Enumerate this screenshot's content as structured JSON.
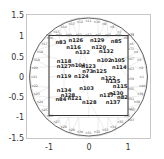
{
  "chart_data": {
    "type": "scatter",
    "title": "",
    "xlabel": "",
    "ylabel": "",
    "xlim": [
      -1.55,
      1.55
    ],
    "ylim": [
      -1.55,
      1.55
    ],
    "xticks": [
      "-1",
      "0",
      "1"
    ],
    "yticks": [
      "1.5",
      "1",
      "0.5",
      "0",
      "-0.5",
      "-1",
      "-1.5"
    ],
    "grid": false,
    "legend": null,
    "shapes": [
      {
        "kind": "circle",
        "center": [
          0,
          0
        ],
        "radius": 1.5,
        "color": "#555555"
      },
      {
        "kind": "square",
        "x": [
          -1,
          1
        ],
        "y": [
          -1,
          1
        ],
        "color": "#333333"
      }
    ],
    "interior_nodes": [
      {
        "label": "n83",
        "x": -0.7,
        "y": 0.86
      },
      {
        "label": "n126",
        "x": -0.32,
        "y": 0.92
      },
      {
        "label": "n129",
        "x": 0.22,
        "y": 0.92
      },
      {
        "label": "n85",
        "x": 0.7,
        "y": 0.88
      },
      {
        "label": "n116",
        "x": -0.38,
        "y": 0.73
      },
      {
        "label": "n120",
        "x": 0.26,
        "y": 0.75
      },
      {
        "label": "n132",
        "x": -0.15,
        "y": 0.62
      },
      {
        "label": "n132",
        "x": 0.45,
        "y": 0.63
      },
      {
        "label": "n118",
        "x": -0.62,
        "y": 0.4
      },
      {
        "label": "n127",
        "x": -0.62,
        "y": 0.27
      },
      {
        "label": "n104",
        "x": -0.26,
        "y": 0.3
      },
      {
        "label": "n102",
        "x": 0.4,
        "y": 0.43
      },
      {
        "label": "n105",
        "x": 0.74,
        "y": 0.43
      },
      {
        "label": "n123",
        "x": 0.0,
        "y": 0.27
      },
      {
        "label": "n73",
        "x": -0.02,
        "y": 0.15
      },
      {
        "label": "n125",
        "x": 0.28,
        "y": 0.15
      },
      {
        "label": "n114",
        "x": 0.78,
        "y": 0.25
      },
      {
        "label": "n119",
        "x": -0.62,
        "y": 0.03
      },
      {
        "label": "n124",
        "x": -0.18,
        "y": 0.03
      },
      {
        "label": "n122",
        "x": 0.5,
        "y": -0.02
      },
      {
        "label": "n135",
        "x": 0.62,
        "y": -0.1
      },
      {
        "label": "n134",
        "x": -0.62,
        "y": -0.32
      },
      {
        "label": "n103",
        "x": -0.05,
        "y": -0.28
      },
      {
        "label": "n115",
        "x": 0.8,
        "y": -0.22
      },
      {
        "label": "n128",
        "x": -0.52,
        "y": -0.45
      },
      {
        "label": "n117",
        "x": 0.46,
        "y": -0.45
      },
      {
        "label": "n130",
        "x": 0.7,
        "y": -0.4
      },
      {
        "label": "n82",
        "x": 0.86,
        "y": -0.5
      },
      {
        "label": "n84",
        "x": -0.7,
        "y": -0.55
      },
      {
        "label": "n121",
        "x": -0.35,
        "y": -0.52
      },
      {
        "label": "n128",
        "x": 0.02,
        "y": -0.62
      },
      {
        "label": "n137",
        "x": 0.62,
        "y": -0.62
      }
    ]
  },
  "axes": {
    "x_ticks": [
      {
        "label": "-1",
        "px": 49
      },
      {
        "label": "0",
        "px": 89
      },
      {
        "label": "1",
        "px": 128
      }
    ],
    "y_ticks": [
      {
        "label": "1.5",
        "py": 15
      },
      {
        "label": "1",
        "py": 36
      },
      {
        "label": "0.5",
        "py": 57
      },
      {
        "label": "0",
        "py": 77
      },
      {
        "label": "-0.5",
        "py": 97
      },
      {
        "label": "-1",
        "py": 117
      },
      {
        "label": "-1.5",
        "py": 138
      }
    ]
  }
}
